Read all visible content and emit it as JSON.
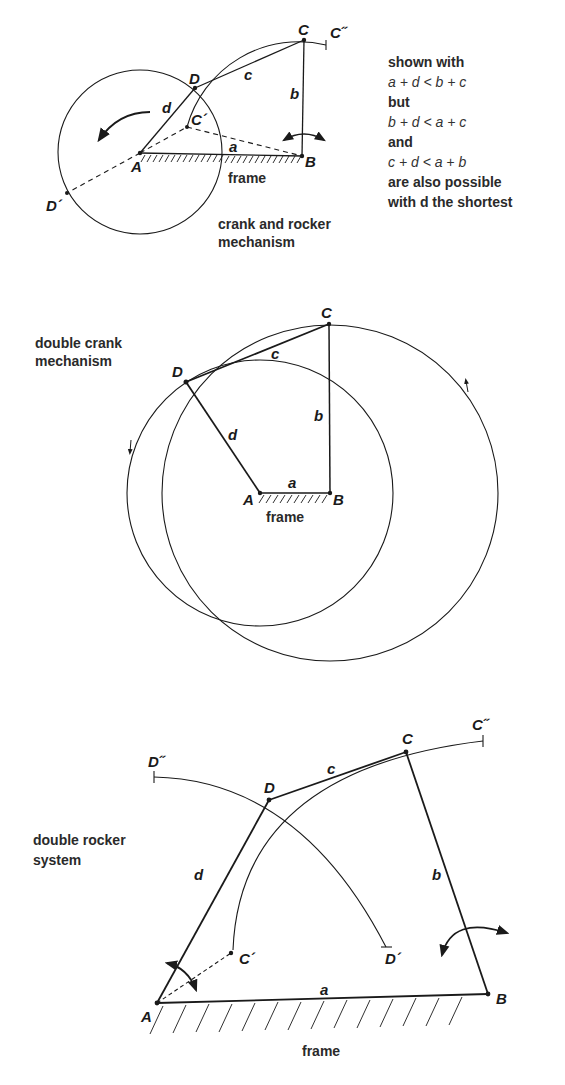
{
  "diagrams": {
    "crank_rocker": {
      "caption_line1": "crank and rocker",
      "caption_line2": "mechanism",
      "points": {
        "A": "A",
        "B": "B",
        "C": "C",
        "D": "D",
        "C1": "C´",
        "C2": "C˝",
        "D1": "D´"
      },
      "links": {
        "a": "a",
        "b": "b",
        "c": "c",
        "d": "d"
      },
      "frame": "frame"
    },
    "double_crank": {
      "caption_line1": "double crank",
      "caption_line2": "mechanism",
      "points": {
        "A": "A",
        "B": "B",
        "C": "C",
        "D": "D"
      },
      "links": {
        "a": "a",
        "b": "b",
        "c": "c",
        "d": "d"
      },
      "frame": "frame"
    },
    "double_rocker": {
      "caption_line1": "double rocker",
      "caption_line2": "system",
      "points": {
        "A": "A",
        "B": "B",
        "C": "C",
        "D": "D",
        "C1": "C´",
        "C2": "C˝",
        "D1": "D´",
        "D2": "D˝"
      },
      "links": {
        "a": "a",
        "b": "b",
        "c": "c",
        "d": "d"
      },
      "frame": "frame"
    }
  },
  "note": {
    "line1": "shown with",
    "line2": "a + d < b + c",
    "line3": "but",
    "line4": "b + d < a + c",
    "line5": "and",
    "line6": "c + d < a + b",
    "line7": "are also possible",
    "line8": "with d the shortest"
  }
}
